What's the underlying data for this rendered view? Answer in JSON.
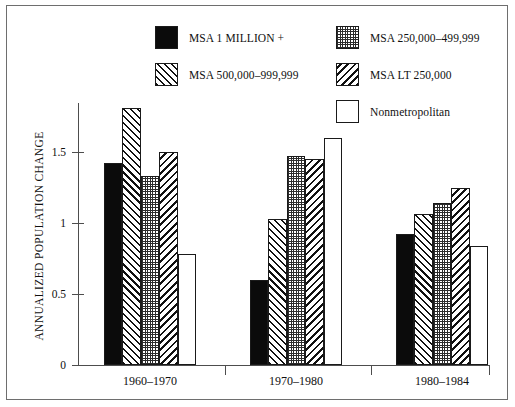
{
  "chart_data": {
    "type": "bar",
    "title": "",
    "xlabel": "",
    "ylabel": "ANNUALIZED POPULATION CHANGE",
    "ylim": [
      0,
      1.85
    ],
    "yticks": [
      0,
      0.5,
      1,
      1.5
    ],
    "ytick_labels": [
      "0",
      "0.5",
      "1",
      "1.5"
    ],
    "grid": false,
    "legend_position": "top-center",
    "categories": [
      "1960–1970",
      "1970–1980",
      "1980–1984"
    ],
    "series": [
      {
        "name": "MSA 1 MILLION +",
        "pattern": "solid-black",
        "values": [
          1.42,
          0.6,
          0.92
        ]
      },
      {
        "name": "MSA 500,000–999,999",
        "pattern": "forward-diagonal-hatch",
        "values": [
          1.81,
          1.03,
          1.06
        ]
      },
      {
        "name": "MSA 250,000–499,999",
        "pattern": "dot-grid",
        "values": [
          1.33,
          1.47,
          1.14
        ]
      },
      {
        "name": "MSA LT 250,000",
        "pattern": "backward-diagonal-hatch",
        "values": [
          1.5,
          1.45,
          1.25
        ]
      },
      {
        "name": "Nonmetropolitan",
        "pattern": "white-empty",
        "values": [
          0.78,
          1.6,
          0.84
        ]
      }
    ]
  },
  "legend": {
    "entries": [
      {
        "label": "MSA 1 MILLION +",
        "pattern": "solid-black"
      },
      {
        "label": "MSA 500,000–999,999",
        "pattern": "forward-diagonal-hatch"
      },
      {
        "label": "MSA 250,000–499,999",
        "pattern": "dot-grid"
      },
      {
        "label": "MSA LT 250,000",
        "pattern": "backward-diagonal-hatch"
      },
      {
        "label": "Nonmetropolitan",
        "pattern": "white-empty"
      }
    ]
  },
  "colors": {
    "axis": "#4d4d4d",
    "frame": "#6e6e6e",
    "ink": "#101010",
    "background": "#ffffff"
  }
}
